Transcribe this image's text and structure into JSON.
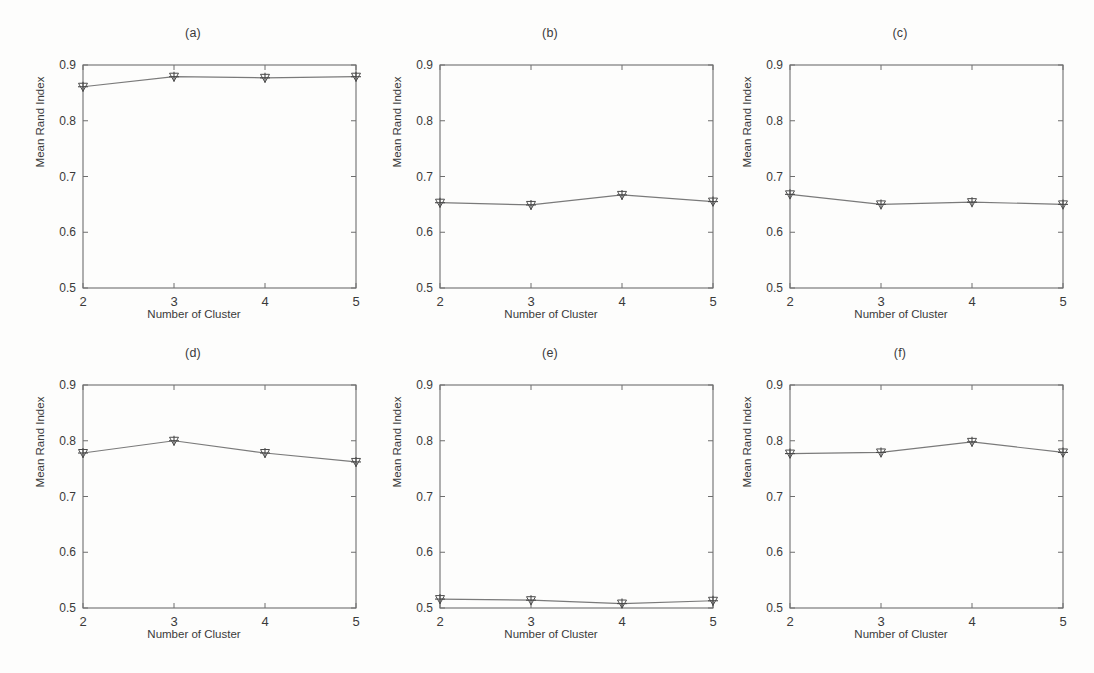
{
  "figure": {
    "background_color": "#fdfdfc",
    "axis_color": "#6e6e6e",
    "line_color": "#7a7a7a",
    "marker_color": "#4a4a4a",
    "text_color": "#3a3a3a",
    "rows": 2,
    "cols": 3
  },
  "common": {
    "xlabel": "Number of Cluster",
    "ylabel": "Mean Rand Index",
    "xticks": [
      "2",
      "3",
      "4",
      "5"
    ],
    "yticks": [
      "0.5",
      "0.6",
      "0.7",
      "0.8",
      "0.9"
    ],
    "marker_icon": "plus-triangle-marker"
  },
  "chart_data": [
    {
      "type": "line",
      "title": "(a)",
      "xlabel": "Number of Cluster",
      "ylabel": "Mean Rand Index",
      "x": [
        2,
        3,
        4,
        5
      ],
      "values": [
        0.861,
        0.879,
        0.877,
        0.879
      ],
      "xlim": [
        2,
        5
      ],
      "ylim": [
        0.5,
        0.9
      ],
      "xticks": [
        2,
        3,
        4,
        5
      ],
      "yticks": [
        0.5,
        0.6,
        0.7,
        0.8,
        0.9
      ],
      "grid": false,
      "legend": null,
      "marker": "plus-triangle"
    },
    {
      "type": "line",
      "title": "(b)",
      "xlabel": "Number of Cluster",
      "ylabel": "Mean Rand Index",
      "x": [
        2,
        3,
        4,
        5
      ],
      "values": [
        0.653,
        0.649,
        0.667,
        0.655
      ],
      "xlim": [
        2,
        5
      ],
      "ylim": [
        0.5,
        0.9
      ],
      "xticks": [
        2,
        3,
        4,
        5
      ],
      "yticks": [
        0.5,
        0.6,
        0.7,
        0.8,
        0.9
      ],
      "grid": false,
      "legend": null,
      "marker": "plus-triangle"
    },
    {
      "type": "line",
      "title": "(c)",
      "xlabel": "Number of Cluster",
      "ylabel": "Mean Rand Index",
      "x": [
        2,
        3,
        4,
        5
      ],
      "values": [
        0.668,
        0.65,
        0.654,
        0.65
      ],
      "xlim": [
        2,
        5
      ],
      "ylim": [
        0.5,
        0.9
      ],
      "xticks": [
        2,
        3,
        4,
        5
      ],
      "yticks": [
        0.5,
        0.6,
        0.7,
        0.8,
        0.9
      ],
      "grid": false,
      "legend": null,
      "marker": "plus-triangle"
    },
    {
      "type": "line",
      "title": "(d)",
      "xlabel": "Number of Cluster",
      "ylabel": "Mean Rand Index",
      "x": [
        2,
        3,
        4,
        5
      ],
      "values": [
        0.778,
        0.8,
        0.778,
        0.762
      ],
      "xlim": [
        2,
        5
      ],
      "ylim": [
        0.5,
        0.9
      ],
      "xticks": [
        2,
        3,
        4,
        5
      ],
      "yticks": [
        0.5,
        0.6,
        0.7,
        0.8,
        0.9
      ],
      "grid": false,
      "legend": null,
      "marker": "plus-triangle"
    },
    {
      "type": "line",
      "title": "(e)",
      "xlabel": "Number of Cluster",
      "ylabel": "Mean Rand Index",
      "x": [
        2,
        3,
        4,
        5
      ],
      "values": [
        0.516,
        0.514,
        0.508,
        0.513
      ],
      "xlim": [
        2,
        5
      ],
      "ylim": [
        0.5,
        0.9
      ],
      "xticks": [
        2,
        3,
        4,
        5
      ],
      "yticks": [
        0.5,
        0.6,
        0.7,
        0.8,
        0.9
      ],
      "grid": false,
      "legend": null,
      "marker": "plus-triangle"
    },
    {
      "type": "line",
      "title": "(f)",
      "xlabel": "Number of Cluster",
      "ylabel": "Mean Rand Index",
      "x": [
        2,
        3,
        4,
        5
      ],
      "values": [
        0.777,
        0.779,
        0.798,
        0.779
      ],
      "xlim": [
        2,
        5
      ],
      "ylim": [
        0.5,
        0.9
      ],
      "xticks": [
        2,
        3,
        4,
        5
      ],
      "yticks": [
        0.5,
        0.6,
        0.7,
        0.8,
        0.9
      ],
      "grid": false,
      "legend": null,
      "marker": "plus-triangle"
    }
  ]
}
